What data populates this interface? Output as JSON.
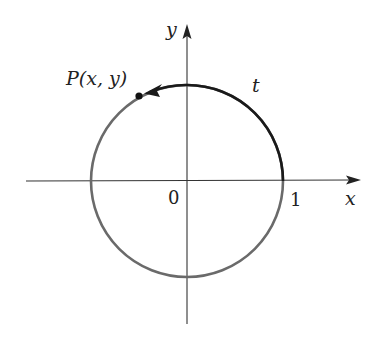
{
  "figure": {
    "labels": {
      "point": "P(x, y)",
      "arc": "t",
      "x_axis": "x",
      "y_axis": "y",
      "origin": "0",
      "unit_tick": "1"
    },
    "colors": {
      "axes": "#333333",
      "circle": "#666666",
      "arc_t": "#1a1a1a",
      "point": "#111111"
    },
    "geometry": {
      "circle_radius": 1,
      "arc_start_angle_deg": 0,
      "arc_end_angle_deg": 119,
      "arc_direction": "counterclockwise"
    }
  }
}
